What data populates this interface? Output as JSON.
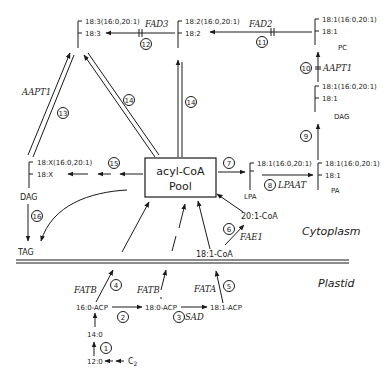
{
  "regions": {
    "cytoplasm": "Cytoplasm",
    "plastid": "Plastid"
  },
  "pool": {
    "line1": "acyl-CoA",
    "line2": "Pool"
  },
  "lipids": {
    "pc": {
      "name": "PC",
      "sn1": "18:1(16:0,20:1)",
      "sn2": "18:1"
    },
    "pc_fad2": {
      "sn1": "18:2(16:0,20:1)",
      "sn2": "18:2"
    },
    "pc_fad3": {
      "sn1": "18:3(16:0,20:1)",
      "sn2": "18:3"
    },
    "dag_right": {
      "name": "DAG",
      "sn1": "18:1(16:0,20:1)",
      "sn2": "18:1"
    },
    "pa": {
      "name": "PA",
      "sn1": "18:1(16:0,20:1)",
      "sn2": "18:1"
    },
    "lpa": {
      "name": "LPA",
      "sn1": "18:1(16:0,20:1)"
    },
    "dag_left": {
      "name": "DAG",
      "sn1": "18:X(16:0,20:1)",
      "sn2": "18:X"
    },
    "tag": {
      "name": "TAG"
    }
  },
  "metabolites": {
    "c20_1_coa": "20:1-CoA",
    "c18_1_coa": "18:1-CoA",
    "c16_0_acp": "16:0-ACP",
    "c18_0_acp": "18:0-ACP",
    "c18_1_acp": "18:1-ACP",
    "c14_0": "14:0",
    "c12_0": "12:0",
    "c2": "C",
    "c2_sub": "2"
  },
  "enzymes": {
    "fad3": "FAD3",
    "fad2": "FAD2",
    "aapt1_right": "AAPT1",
    "aapt1_left": "AAPT1",
    "lpaat": "LPAAT",
    "fae1": "FAE1",
    "fatb_1": "FATB",
    "fatb_2": "FATB",
    "fata": "FATA",
    "sad": "SAD"
  },
  "steps": [
    "1",
    "2",
    "3",
    "4",
    "5",
    "6",
    "7",
    "8",
    "9",
    "10",
    "11",
    "12",
    "13",
    "14",
    "14",
    "15",
    "16"
  ]
}
